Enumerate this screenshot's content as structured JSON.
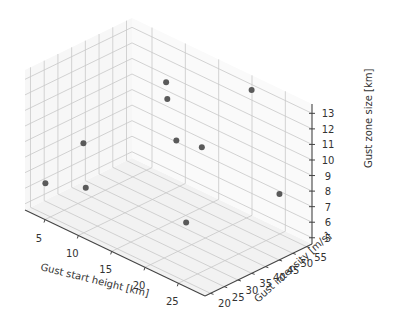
{
  "chart_data": {
    "type": "scatter",
    "projection": "3d",
    "title": "",
    "xlabel": "Gust start height [km]",
    "ylabel": "Gust intensity [m/s]",
    "zlabel": "Gust zone size [km]",
    "xlim": [
      2,
      29
    ],
    "ylim": [
      18,
      57
    ],
    "zlim": [
      4.6,
      13.6
    ],
    "xticks": [
      5,
      10,
      15,
      20,
      25
    ],
    "yticks": [
      20,
      25,
      30,
      35,
      40,
      45,
      50,
      55
    ],
    "zticks": [
      5,
      6,
      7,
      8,
      9,
      10,
      11,
      12,
      13
    ],
    "grid": true,
    "marker_color": "#5a5a5a",
    "points": [
      {
        "x": 22,
        "y": 52,
        "z": 13.5
      },
      {
        "x": 10,
        "y": 50,
        "z": 11.7
      },
      {
        "x": 11,
        "y": 48,
        "z": 11.0
      },
      {
        "x": 5,
        "y": 32,
        "z": 8.3
      },
      {
        "x": 14,
        "y": 44,
        "z": 9.3
      },
      {
        "x": 17,
        "y": 46,
        "z": 9.3
      },
      {
        "x": 27,
        "y": 50,
        "z": 8.0
      },
      {
        "x": 3,
        "y": 23,
        "z": 6.1
      },
      {
        "x": 7,
        "y": 28,
        "z": 6.2
      },
      {
        "x": 20,
        "y": 33,
        "z": 6.2
      }
    ]
  }
}
